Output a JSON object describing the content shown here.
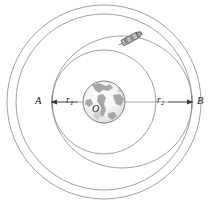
{
  "figure": {
    "type": "orbital-transfer-diagram",
    "background_color": "#ffffff",
    "line_color": "#6b6b6b",
    "label_color": "#1c1c1c",
    "labels": {
      "point_a": "A",
      "point_b": "B",
      "center": "O",
      "radius_inner": "r",
      "radius_inner_sub": "1",
      "radius_outer": "r",
      "radius_outer_sub": "2"
    },
    "elements": {
      "earth_name": "earth-sphere",
      "inner_orbit_name": "inner-circular-orbit",
      "outer_orbit_name": "outer-circular-orbit",
      "transfer_orbit_name": "elliptical-transfer-orbit",
      "spacecraft_name": "spacecraft",
      "axis_name": "horizontal-axis-line"
    },
    "geometry": {
      "center_x": 104,
      "center_y": 102,
      "earth_radius": 21,
      "inner_orbit_radius": 52,
      "outer_orbit_radius": 88,
      "outer_boundary_radius": 97
    }
  }
}
